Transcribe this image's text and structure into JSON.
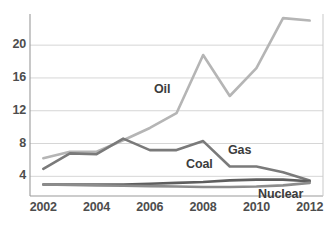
{
  "chart_data": {
    "type": "line",
    "title": "",
    "xlabel": "",
    "ylabel": "",
    "x": [
      2002,
      2003,
      2004,
      2005,
      2006,
      2007,
      2008,
      2009,
      2010,
      2011,
      2012
    ],
    "xlim": [
      2001.5,
      2012.5
    ],
    "ylim": [
      1.6,
      23.8
    ],
    "grid": true,
    "gridlines_y": [
      4,
      8,
      12,
      16,
      20
    ],
    "legend_position": "inline-labels",
    "y_ticks": [
      "4",
      "8",
      "12",
      "16",
      "20"
    ],
    "x_ticks": [
      "2002",
      "2004",
      "2006",
      "2008",
      "2010",
      "2012"
    ],
    "series": [
      {
        "name": "Oil",
        "color": "#b5b5b5",
        "values": [
          6.2,
          7.0,
          7.0,
          8.4,
          9.9,
          11.7,
          18.8,
          13.8,
          17.2,
          23.3,
          23.0
        ]
      },
      {
        "name": "Gas",
        "color": "#7a7a7a",
        "values": [
          4.9,
          6.8,
          6.7,
          8.6,
          7.2,
          7.2,
          8.3,
          5.2,
          5.2,
          4.5,
          3.5
        ]
      },
      {
        "name": "Coal",
        "color": "#5e5e5e",
        "values": [
          3.0,
          3.0,
          3.0,
          3.0,
          3.1,
          3.2,
          3.3,
          3.5,
          3.6,
          3.6,
          3.4
        ]
      },
      {
        "name": "Nuclear",
        "color": "#8c8c8c",
        "values": [
          3.0,
          2.95,
          2.9,
          2.85,
          2.8,
          2.75,
          2.7,
          2.7,
          2.75,
          2.9,
          3.2
        ]
      }
    ],
    "series_label_positions": [
      {
        "name": "Oil",
        "x": 154,
        "y": 82
      },
      {
        "name": "Gas",
        "x": 228,
        "y": 143
      },
      {
        "name": "Coal",
        "x": 186,
        "y": 157
      },
      {
        "name": "Nuclear",
        "x": 258,
        "y": 187
      }
    ]
  },
  "axis_colors": {
    "gridline": "#d6d6d6",
    "axis": "#9a9a9a",
    "tick_text": "#4d4d4d"
  }
}
